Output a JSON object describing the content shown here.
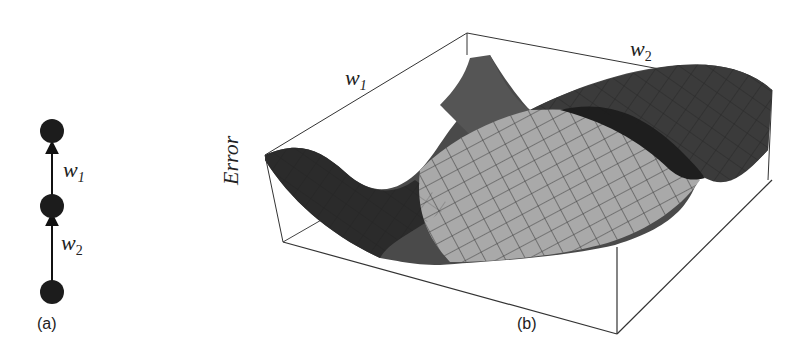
{
  "panel_a": {
    "caption": "(a)",
    "nodes": [
      "top-node",
      "middle-node",
      "bottom-node"
    ],
    "edges": [
      {
        "from": "middle-node",
        "to": "top-node",
        "label_base": "w",
        "label_sub": "1"
      },
      {
        "from": "bottom-node",
        "to": "middle-node",
        "label_base": "w",
        "label_sub": "2"
      }
    ]
  },
  "panel_b": {
    "caption": "(b)",
    "axis_w1": {
      "base": "w",
      "sub": "1"
    },
    "axis_w2": {
      "base": "w",
      "sub": "2"
    },
    "axis_z": "Error",
    "description": "3D error surface over weights w1 and w2"
  }
}
